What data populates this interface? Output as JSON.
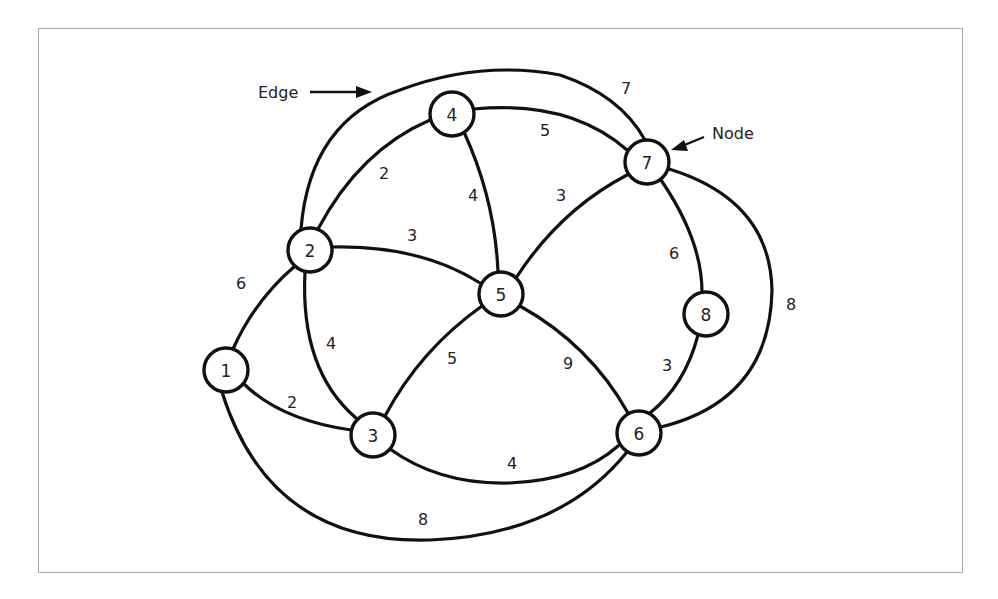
{
  "diagram": {
    "type": "weighted-undirected-graph",
    "annotations": {
      "edge_label": "Edge",
      "node_label": "Node"
    },
    "nodes": [
      {
        "id": "1",
        "label": "1",
        "x": 226,
        "y": 370
      },
      {
        "id": "2",
        "label": "2",
        "x": 310,
        "y": 250
      },
      {
        "id": "3",
        "label": "3",
        "x": 373,
        "y": 435
      },
      {
        "id": "4",
        "label": "4",
        "x": 452,
        "y": 114
      },
      {
        "id": "5",
        "label": "5",
        "x": 501,
        "y": 294
      },
      {
        "id": "6",
        "label": "6",
        "x": 639,
        "y": 433
      },
      {
        "id": "7",
        "label": "7",
        "x": 647,
        "y": 162
      },
      {
        "id": "8",
        "label": "8",
        "x": 706,
        "y": 314
      }
    ],
    "edges": [
      {
        "from": "1",
        "to": "2",
        "weight": "6"
      },
      {
        "from": "1",
        "to": "3",
        "weight": "2"
      },
      {
        "from": "1",
        "to": "6",
        "weight": "8"
      },
      {
        "from": "2",
        "to": "3",
        "weight": "4"
      },
      {
        "from": "2",
        "to": "4",
        "weight": "2"
      },
      {
        "from": "2",
        "to": "5",
        "weight": "3"
      },
      {
        "from": "2",
        "to": "7",
        "weight": "7"
      },
      {
        "from": "4",
        "to": "5",
        "weight": "4"
      },
      {
        "from": "4",
        "to": "7",
        "weight": "5"
      },
      {
        "from": "5",
        "to": "7",
        "weight": "3"
      },
      {
        "from": "3",
        "to": "5",
        "weight": "5"
      },
      {
        "from": "5",
        "to": "6",
        "weight": "9"
      },
      {
        "from": "3",
        "to": "6",
        "weight": "4"
      },
      {
        "from": "7",
        "to": "8",
        "weight": "6"
      },
      {
        "from": "8",
        "to": "6",
        "weight": "3"
      },
      {
        "from": "7",
        "to": "6",
        "weight": "8"
      }
    ]
  },
  "weights": {
    "e12": "6",
    "e13": "2",
    "e16": "8",
    "e23": "4",
    "e24": "2",
    "e25": "3",
    "e27": "7",
    "e45": "4",
    "e47": "5",
    "e57": "3",
    "e35": "5",
    "e56": "9",
    "e36": "4",
    "e78": "6",
    "e86": "3",
    "e76": "8"
  },
  "nodes": {
    "n1": "1",
    "n2": "2",
    "n3": "3",
    "n4": "4",
    "n5": "5",
    "n6": "6",
    "n7": "7",
    "n8": "8"
  },
  "colors": {
    "stroke": "#111111",
    "frame_border": "#a8a8a8",
    "background": "#ffffff"
  }
}
